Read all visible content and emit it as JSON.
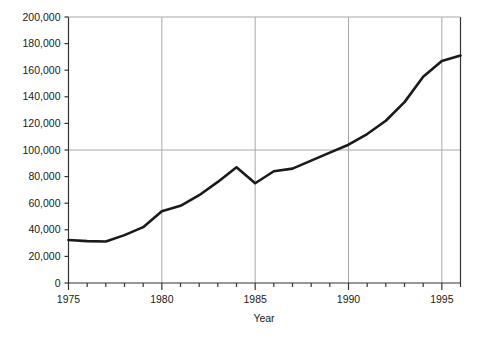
{
  "chart_data": {
    "type": "line",
    "title": "",
    "xlabel": "Year",
    "ylabel": "",
    "xlim": [
      1975,
      1996
    ],
    "ylim": [
      0,
      200000
    ],
    "grid": true,
    "legend": false,
    "x": [
      1975,
      1976,
      1977,
      1978,
      1979,
      1980,
      1981,
      1982,
      1983,
      1984,
      1985,
      1986,
      1987,
      1988,
      1989,
      1990,
      1991,
      1992,
      1993,
      1994,
      1995,
      1996
    ],
    "values": [
      32300,
      31500,
      31200,
      36000,
      42000,
      54000,
      58000,
      66000,
      76000,
      87000,
      75000,
      84000,
      86000,
      92000,
      98000,
      104000,
      112000,
      122000,
      136000,
      155000,
      167000,
      171000
    ],
    "series": [
      {
        "name": "series-1",
        "color": "#1a1a1a",
        "values": [
          32300,
          31500,
          31200,
          36000,
          42000,
          54000,
          58000,
          66000,
          76000,
          87000,
          75000,
          84000,
          86000,
          92000,
          98000,
          104000,
          112000,
          122000,
          136000,
          155000,
          167000,
          171000
        ]
      }
    ],
    "y_ticks": [
      0,
      20000,
      40000,
      60000,
      80000,
      100000,
      120000,
      140000,
      160000,
      180000,
      200000
    ],
    "y_tick_labels": [
      "0",
      "20,000",
      "40,000",
      "60,000",
      "80,000",
      "100,000",
      "120,000",
      "140,000",
      "160,000",
      "180,000",
      "200,000"
    ],
    "x_ticks": [
      1975,
      1976,
      1977,
      1978,
      1979,
      1980,
      1981,
      1982,
      1983,
      1984,
      1985,
      1986,
      1987,
      1988,
      1989,
      1990,
      1991,
      1992,
      1993,
      1994,
      1995,
      1996
    ],
    "x_major_ticks": [
      1975,
      1980,
      1985,
      1990,
      1995
    ],
    "x_major_tick_labels": [
      "1975",
      "1980",
      "1985",
      "1990",
      "1995"
    ],
    "gridlines_y": [
      100000,
      200000
    ],
    "gridlines_x": [
      1980,
      1985,
      1990,
      1995
    ],
    "colors": {
      "line": "#1a1a1a",
      "axis": "#333333",
      "grid": "#a8a8a8",
      "background": "#ffffff",
      "text": "#1a1a1a"
    },
    "line_width": 2.6
  }
}
